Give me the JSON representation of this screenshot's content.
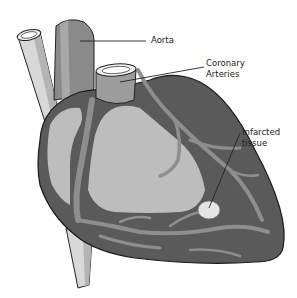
{
  "diagram": {
    "labels": {
      "aorta": "Aorta",
      "coronary_line1": "Coronary",
      "coronary_line2": "Arteries",
      "infarct_line1": "Infarcted",
      "infarct_line2": "tissue"
    },
    "colors": {
      "background": "#ffffff",
      "heart_wall": "#5a5a5a",
      "chamber": "#bdbdbd",
      "artery": "#8e8e8e",
      "vessel_light": "#d6d6d6",
      "aorta": "#8a8a8a",
      "outline": "#1a1a1a",
      "infarct": "#e4e4e4"
    }
  }
}
